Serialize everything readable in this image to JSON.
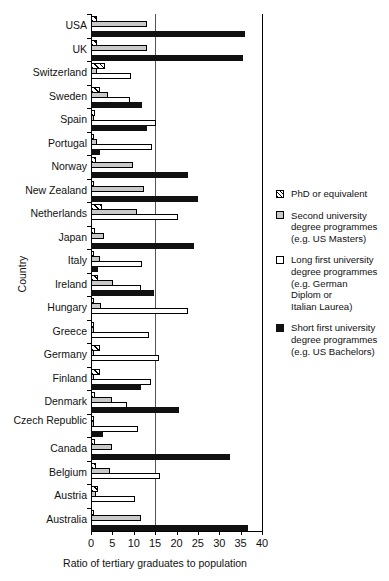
{
  "chart_data": {
    "type": "bar",
    "orientation": "horizontal",
    "title": "",
    "xlabel": "Ratio of tertiary graduates to population",
    "ylabel": "Country",
    "xlim": [
      0,
      40
    ],
    "xticks": [
      0,
      5,
      10,
      15,
      20,
      25,
      30,
      35,
      40
    ],
    "gridlines": [
      15
    ],
    "grid": true,
    "legend_position": "right",
    "categories": [
      "USA",
      "UK",
      "Switzerland",
      "Sweden",
      "Spain",
      "Portugal",
      "Norway",
      "New Zealand",
      "Netherlands",
      "Japan",
      "Italy",
      "Ireland",
      "Hungary",
      "Greece",
      "Germany",
      "Finland",
      "Denmark",
      "Czech Republic",
      "Canada",
      "Belgium",
      "Austria",
      "Australia"
    ],
    "series": [
      {
        "name": "PhD or equivalent",
        "color": "#ffffff",
        "pattern": "diagonal-hatch",
        "values": [
          1.3,
          1.3,
          3.2,
          2.0,
          1.0,
          0.4,
          1.2,
          0.6,
          2.6,
          1.0,
          0.5,
          1.6,
          0.5,
          0.4,
          2.2,
          2.1,
          1.0,
          0.8,
          1.0,
          1.1,
          1.6,
          0.8
        ]
      },
      {
        "name": "Second university degree programmes (e.g. US Masters)",
        "color": "#c9c9c9",
        "values": [
          13.2,
          13.0,
          1.4,
          3.9,
          0.2,
          1.5,
          9.9,
          12.5,
          10.8,
          3.0,
          2.0,
          5.2,
          2.3,
          0.3,
          0.2,
          0.2,
          4.8,
          0.2,
          5.0,
          4.5,
          1.2,
          11.8
        ]
      },
      {
        "name": "Long first university degree programmes (e.g. German Diplom or Italian Laurea)",
        "color": "#ffffff",
        "values": [
          0.0,
          0.0,
          9.4,
          9.2,
          15.3,
          14.3,
          0.0,
          0.0,
          20.3,
          0.0,
          12.0,
          11.8,
          22.6,
          13.6,
          16.0,
          14.0,
          8.5,
          11.0,
          0.0,
          16.2,
          10.3,
          0.0
        ]
      },
      {
        "name": "Short first university degree programmes (e.g. US Bachelors)",
        "color": "#111111",
        "values": [
          36.0,
          35.5,
          0.0,
          12.0,
          13.0,
          2.0,
          22.8,
          25.0,
          0.0,
          24.0,
          1.6,
          14.8,
          0.0,
          0.0,
          0.0,
          11.8,
          20.5,
          2.8,
          32.5,
          0.0,
          0.0,
          36.7
        ]
      }
    ]
  },
  "legend": {
    "items": [
      {
        "key": "phd",
        "lines": [
          "PhD or equivalent"
        ]
      },
      {
        "key": "second",
        "lines": [
          "Second university",
          "degree programmes",
          "(e.g. US Masters)"
        ]
      },
      {
        "key": "longfirst",
        "lines": [
          "Long first university",
          "degree programmes",
          "(e.g. German",
          "Diplom or",
          "Italian Laurea)"
        ]
      },
      {
        "key": "shortfirst",
        "lines": [
          "Short first university",
          "degree programmes",
          "(e.g. US Bachelors)"
        ]
      }
    ]
  }
}
